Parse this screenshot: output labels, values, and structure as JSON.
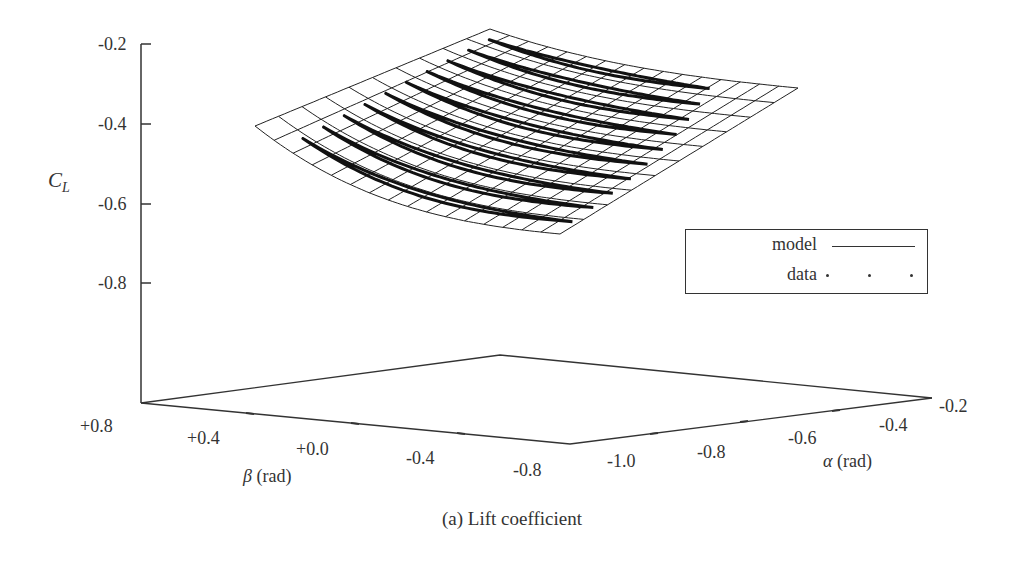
{
  "chart_data": {
    "type": "surface3d",
    "title": "",
    "caption": "(a) Lift coefficient",
    "zlabel": "C_L",
    "xlabel": "β (rad)",
    "ylabel": "α (rad)",
    "z_ticks": [
      "-0.2",
      "-0.4",
      "-0.6",
      "-0.8"
    ],
    "z_range": [
      -1.0,
      -0.2
    ],
    "beta_ticks": [
      "+0.8",
      "+0.4",
      "+0.0",
      "-0.4",
      "-0.8"
    ],
    "beta_range": [
      0.8,
      -0.8
    ],
    "alpha_ticks": [
      "-1.0",
      "-0.8",
      "-0.6",
      "-0.4",
      "-0.2"
    ],
    "alpha_range": [
      -1.0,
      -0.2
    ],
    "legend": {
      "position": "right",
      "entries": [
        {
          "label": "model",
          "style": "line"
        },
        {
          "label": "data",
          "style": "dots"
        }
      ]
    },
    "series": [
      {
        "name": "model",
        "kind": "wireframe surface",
        "description": "Quadratic bowl in β, C_L decreasing with α; approx. C_L ≈ -0.25 at α=-0.2, -0.66 at α=-1.0, β=0, rising toward |β|=0.8"
      },
      {
        "name": "data",
        "kind": "closed loops",
        "count": 10
      }
    ],
    "surface_corners": [
      {
        "beta": 0.8,
        "alpha": -1.0,
        "cl": -0.4
      },
      {
        "beta": 0.8,
        "alpha": -0.2,
        "cl": -0.2
      },
      {
        "beta": -0.8,
        "alpha": -0.2,
        "cl": -0.35
      },
      {
        "beta": -0.8,
        "alpha": -1.0,
        "cl": -0.66
      }
    ],
    "grid": false
  },
  "axes": {
    "z_axis": {
      "label_main": "C",
      "label_sub": "L"
    },
    "beta_axis": {
      "symbol": "β",
      "unit": " (rad)"
    },
    "alpha_axis": {
      "symbol": "α",
      "unit": " (rad)"
    }
  },
  "legend": {
    "model_label": "model",
    "data_label": "data"
  },
  "caption": "(a) Lift coefficient"
}
